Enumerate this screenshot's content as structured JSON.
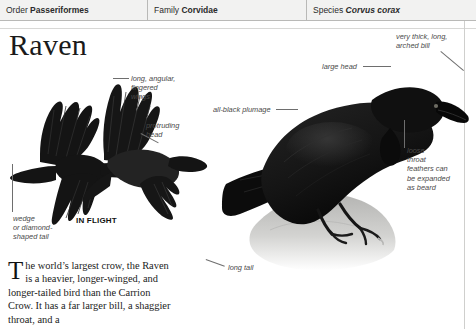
{
  "taxonomy": [
    {
      "label": "Order ",
      "value": "Passeriformes",
      "italic": false
    },
    {
      "label": "Family ",
      "value": "Corvidae",
      "italic": false
    },
    {
      "label": "Species ",
      "value": "Corvus corax",
      "italic": true
    }
  ],
  "page_title": "Raven",
  "annotations": {
    "fingered_wings": "long, angular,\nfingered\nwings",
    "protruding_head": "protruding\nhead",
    "wedge_tail": "wedge\nor diamond-\nshaped tail",
    "in_flight": "IN FLIGHT",
    "all_black_plumage": "all-black plumage",
    "large_head": "large head",
    "arched_bill": "very thick, long,\narched bill",
    "throat_feathers": "loose\nthroat\nfeathers can\nbe expanded\nas beard",
    "long_tail": "long tail"
  },
  "body": {
    "dropcap": "T",
    "text": "he world’s largest crow, the Raven is a heavier, longer-winged, and longer-tailed bird than the Carrion Crow. It has a far larger bill, a shaggier throat, and a"
  },
  "colors": {
    "header_bg": "#f2f2f1",
    "header_rule": "#b9b9b7",
    "annotation_text": "#4a4a4a",
    "body_text": "#1b1b1b",
    "plumage": "#111111",
    "rock": "#c9c9c7"
  }
}
